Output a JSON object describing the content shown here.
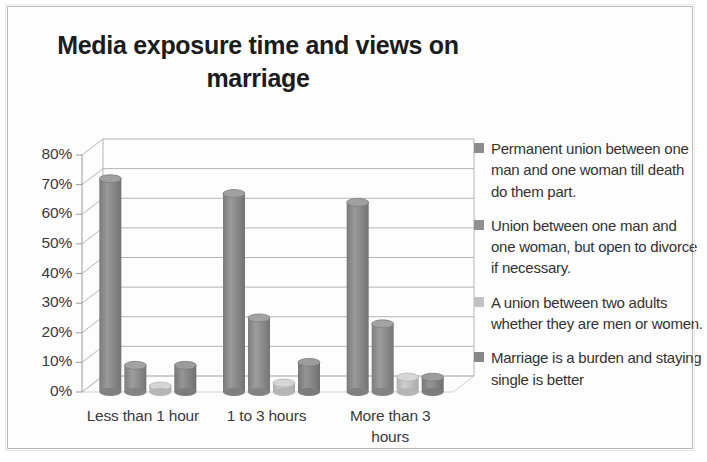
{
  "chart_data": {
    "type": "bar",
    "title": "Media exposure time and views on marriage",
    "xlabel": "",
    "ylabel": "",
    "ylim": [
      0,
      80
    ],
    "ytick_labels": [
      "80%",
      "70%",
      "60%",
      "50%",
      "40%",
      "30%",
      "20%",
      "10%",
      "0%"
    ],
    "ytick_values": [
      80,
      70,
      60,
      50,
      40,
      30,
      20,
      10,
      0
    ],
    "grid": true,
    "legend_position": "right",
    "style": "3d-clustered-column",
    "categories": [
      "Less than 1 hour",
      "1 to 3 hours",
      "More than 3 hours"
    ],
    "series": [
      {
        "name": "Permanent union between one man and one woman till death do them part.",
        "color": "#8c8c8c",
        "values": [
          72,
          67,
          64
        ]
      },
      {
        "name": "Union between one man and one woman, but open to divorce if necessary.",
        "color": "#8f8f8f",
        "values": [
          9,
          25,
          23
        ]
      },
      {
        "name": "A union between two adults whether they are men or women.",
        "color": "#c2c2c2",
        "values": [
          2,
          3,
          5
        ]
      },
      {
        "name": "Marriage is a burden and staying single is better",
        "color": "#888888",
        "values": [
          9,
          10,
          5
        ]
      }
    ]
  },
  "legend": {
    "items": [
      {
        "label": "Permanent union between one man and one woman till death do them part.",
        "color": "#8c8c8c"
      },
      {
        "label": "Union between one man and one woman, but open to divorce if necessary.",
        "color": "#8f8f8f"
      },
      {
        "label": "A union between two adults whether they are men or women.",
        "color": "#c2c2c2"
      },
      {
        "label": "Marriage is a burden and staying single is better",
        "color": "#888888"
      }
    ]
  },
  "axis_colors": {
    "gridline": "#b4b4b4",
    "axis_line": "#9a9a9a",
    "floor": "#cfcfcf"
  }
}
